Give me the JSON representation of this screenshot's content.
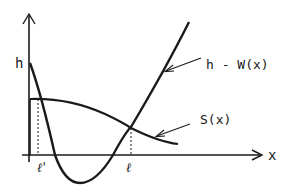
{
  "diagram": {
    "title": "",
    "colors": {
      "ink": "#1a1a1a",
      "background": "#ffffff"
    },
    "axes": {
      "y_label": "h",
      "x_label": "x"
    },
    "curves": [
      {
        "id": "h-minus-w",
        "label": "h - W(x)"
      },
      {
        "id": "s",
        "label": "S(x)"
      }
    ],
    "markers": {
      "l_prime": "ℓ'",
      "l": "ℓ"
    }
  }
}
